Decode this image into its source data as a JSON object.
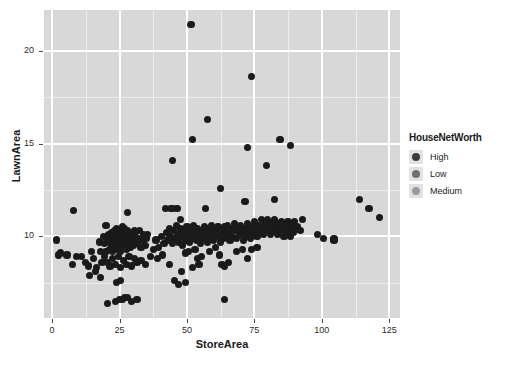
{
  "chart_data": {
    "type": "scatter",
    "title": "",
    "xlabel": "StoreArea",
    "ylabel": "LawnArea",
    "xlim": [
      -3,
      129
    ],
    "ylim": [
      5.6,
      22.2
    ],
    "xticks": [
      0,
      25,
      50,
      75,
      100,
      125
    ],
    "yticks": [
      10,
      15,
      20
    ],
    "grid": true,
    "panel_background": "#d8d8d8",
    "grid_color": "#ffffff",
    "point_color": "#1a1a1a",
    "legend": {
      "title": "HouseNetWorth",
      "position": "right",
      "entries": [
        {
          "label": "High",
          "color": "#3b3b3b"
        },
        {
          "label": "Low",
          "color": "#6e6e6e"
        },
        {
          "label": "Medium",
          "color": "#9a9a9a"
        }
      ]
    },
    "series": [
      {
        "name": "HouseNetWorth",
        "points": [
          [
            51.5,
            21.4
          ],
          [
            74.0,
            18.6
          ],
          [
            57.5,
            16.3
          ],
          [
            52.0,
            15.2
          ],
          [
            72.5,
            14.8
          ],
          [
            84.5,
            15.2
          ],
          [
            88.5,
            14.9
          ],
          [
            79.5,
            13.8
          ],
          [
            44.5,
            14.1
          ],
          [
            62.5,
            12.6
          ],
          [
            82.5,
            12.0
          ],
          [
            71.5,
            11.9
          ],
          [
            57.0,
            11.5
          ],
          [
            114.0,
            12.0
          ],
          [
            117.5,
            11.5
          ],
          [
            121.5,
            11.0
          ],
          [
            8.0,
            11.4
          ],
          [
            28.0,
            11.3
          ],
          [
            44.0,
            11.5
          ],
          [
            46.5,
            11.5
          ],
          [
            20.0,
            10.6
          ],
          [
            30.5,
            10.3
          ],
          [
            35.5,
            10.1
          ],
          [
            37.5,
            9.3
          ],
          [
            1.5,
            9.8
          ],
          [
            3.0,
            9.1
          ],
          [
            2.5,
            9.0
          ],
          [
            5.5,
            9.0
          ],
          [
            7.5,
            8.5
          ],
          [
            9.0,
            8.9
          ],
          [
            11.0,
            8.9
          ],
          [
            12.5,
            8.6
          ],
          [
            13.5,
            8.4
          ],
          [
            14.5,
            9.2
          ],
          [
            15.5,
            8.8
          ],
          [
            16.5,
            8.3
          ],
          [
            17.5,
            9.7
          ],
          [
            18.0,
            9.2
          ],
          [
            18.5,
            8.6
          ],
          [
            19.0,
            10.0
          ],
          [
            19.5,
            9.6
          ],
          [
            20.0,
            9.2
          ],
          [
            20.5,
            9.9
          ],
          [
            21.0,
            10.1
          ],
          [
            21.5,
            9.7
          ],
          [
            21.5,
            9.3
          ],
          [
            22.0,
            10.2
          ],
          [
            22.0,
            9.5
          ],
          [
            22.5,
            9.9
          ],
          [
            22.5,
            9.2
          ],
          [
            23.0,
            10.3
          ],
          [
            23.0,
            9.6
          ],
          [
            23.5,
            10.0
          ],
          [
            23.5,
            9.3
          ],
          [
            24.0,
            10.4
          ],
          [
            24.0,
            9.8
          ],
          [
            24.5,
            10.1
          ],
          [
            24.5,
            9.4
          ],
          [
            25.0,
            10.3
          ],
          [
            25.0,
            9.7
          ],
          [
            25.5,
            10.0
          ],
          [
            25.5,
            9.2
          ],
          [
            26.0,
            10.5
          ],
          [
            26.0,
            9.9
          ],
          [
            26.5,
            10.2
          ],
          [
            26.5,
            9.5
          ],
          [
            27.0,
            10.4
          ],
          [
            27.0,
            9.8
          ],
          [
            27.5,
            10.1
          ],
          [
            27.5,
            9.3
          ],
          [
            28.0,
            10.3
          ],
          [
            28.0,
            9.6
          ],
          [
            28.5,
            9.9
          ],
          [
            29.0,
            10.2
          ],
          [
            29.0,
            9.4
          ],
          [
            29.5,
            9.8
          ],
          [
            30.0,
            10.1
          ],
          [
            30.0,
            9.5
          ],
          [
            30.5,
            9.9
          ],
          [
            31.0,
            10.2
          ],
          [
            31.5,
            9.6
          ],
          [
            32.0,
            9.9
          ],
          [
            32.5,
            10.3
          ],
          [
            33.0,
            9.4
          ],
          [
            33.5,
            9.8
          ],
          [
            34.0,
            10.1
          ],
          [
            34.5,
            9.5
          ],
          [
            35.0,
            9.9
          ],
          [
            19.5,
            8.9
          ],
          [
            20.5,
            8.6
          ],
          [
            21.5,
            8.4
          ],
          [
            22.5,
            8.8
          ],
          [
            23.5,
            8.5
          ],
          [
            24.5,
            8.9
          ],
          [
            25.5,
            8.3
          ],
          [
            26.5,
            8.7
          ],
          [
            27.5,
            8.5
          ],
          [
            28.5,
            8.9
          ],
          [
            29.5,
            8.4
          ],
          [
            30.5,
            8.8
          ],
          [
            31.5,
            8.6
          ],
          [
            33.0,
            8.7
          ],
          [
            34.5,
            8.5
          ],
          [
            16.0,
            8.1
          ],
          [
            14.0,
            7.9
          ],
          [
            18.0,
            7.8
          ],
          [
            24.0,
            7.5
          ],
          [
            25.5,
            7.6
          ],
          [
            20.5,
            6.4
          ],
          [
            23.5,
            6.5
          ],
          [
            25.0,
            6.6
          ],
          [
            26.0,
            6.6
          ],
          [
            27.0,
            6.7
          ],
          [
            28.0,
            6.7
          ],
          [
            29.5,
            6.5
          ],
          [
            31.5,
            6.6
          ],
          [
            38.5,
            9.8
          ],
          [
            39.5,
            9.4
          ],
          [
            40.5,
            10.0
          ],
          [
            41.5,
            9.6
          ],
          [
            42.5,
            10.2
          ],
          [
            43.0,
            9.8
          ],
          [
            43.5,
            10.4
          ],
          [
            44.0,
            10.0
          ],
          [
            44.5,
            9.6
          ],
          [
            45.0,
            10.3
          ],
          [
            45.5,
            9.9
          ],
          [
            46.0,
            10.6
          ],
          [
            46.5,
            10.1
          ],
          [
            47.0,
            9.7
          ],
          [
            47.5,
            10.4
          ],
          [
            48.0,
            10.0
          ],
          [
            48.5,
            9.5
          ],
          [
            49.0,
            10.2
          ],
          [
            49.5,
            9.8
          ],
          [
            50.0,
            10.5
          ],
          [
            50.5,
            10.1
          ],
          [
            51.0,
            9.7
          ],
          [
            51.5,
            10.3
          ],
          [
            52.0,
            9.9
          ],
          [
            52.5,
            10.6
          ],
          [
            53.0,
            10.2
          ],
          [
            53.5,
            9.8
          ],
          [
            54.0,
            10.4
          ],
          [
            54.5,
            10.0
          ],
          [
            55.0,
            9.6
          ],
          [
            55.5,
            10.3
          ],
          [
            56.0,
            9.9
          ],
          [
            56.5,
            10.5
          ],
          [
            57.0,
            10.1
          ],
          [
            57.5,
            9.7
          ],
          [
            58.0,
            10.4
          ],
          [
            58.5,
            10.0
          ],
          [
            59.0,
            10.6
          ],
          [
            59.5,
            10.2
          ],
          [
            60.0,
            9.8
          ],
          [
            60.5,
            10.4
          ],
          [
            61.0,
            10.0
          ],
          [
            61.5,
            10.5
          ],
          [
            62.0,
            10.1
          ],
          [
            62.5,
            9.7
          ],
          [
            63.0,
            10.3
          ],
          [
            63.5,
            9.9
          ],
          [
            64.0,
            10.5
          ],
          [
            64.5,
            10.1
          ],
          [
            65.0,
            10.6
          ],
          [
            65.5,
            10.2
          ],
          [
            66.0,
            9.8
          ],
          [
            66.5,
            10.4
          ],
          [
            67.0,
            10.0
          ],
          [
            67.5,
            10.7
          ],
          [
            68.0,
            10.3
          ],
          [
            68.5,
            9.9
          ],
          [
            69.0,
            10.5
          ],
          [
            69.5,
            10.1
          ],
          [
            70.0,
            10.6
          ],
          [
            70.5,
            10.2
          ],
          [
            71.0,
            9.8
          ],
          [
            71.5,
            10.4
          ],
          [
            72.0,
            10.0
          ],
          [
            72.5,
            10.7
          ],
          [
            73.0,
            10.3
          ],
          [
            73.5,
            9.9
          ],
          [
            74.0,
            10.5
          ],
          [
            74.5,
            10.1
          ],
          [
            75.0,
            10.8
          ],
          [
            75.5,
            10.4
          ],
          [
            76.0,
            10.0
          ],
          [
            76.5,
            10.6
          ],
          [
            77.0,
            10.2
          ],
          [
            77.5,
            10.9
          ],
          [
            78.0,
            10.5
          ],
          [
            78.5,
            10.1
          ],
          [
            79.0,
            10.7
          ],
          [
            79.5,
            10.3
          ],
          [
            80.0,
            10.9
          ],
          [
            80.5,
            10.5
          ],
          [
            81.0,
            10.1
          ],
          [
            81.5,
            10.7
          ],
          [
            82.0,
            10.3
          ],
          [
            82.5,
            10.9
          ],
          [
            83.0,
            10.5
          ],
          [
            83.5,
            10.1
          ],
          [
            84.0,
            10.7
          ],
          [
            84.5,
            10.3
          ],
          [
            85.0,
            10.8
          ],
          [
            85.5,
            10.4
          ],
          [
            86.0,
            10.0
          ],
          [
            86.5,
            10.6
          ],
          [
            87.0,
            10.2
          ],
          [
            87.5,
            10.8
          ],
          [
            88.0,
            10.4
          ],
          [
            88.5,
            10.0
          ],
          [
            89.0,
            10.6
          ],
          [
            89.5,
            10.2
          ],
          [
            90.0,
            10.8
          ],
          [
            90.5,
            10.4
          ],
          [
            91.0,
            10.5
          ],
          [
            92.0,
            10.3
          ],
          [
            93.0,
            10.9
          ],
          [
            98.5,
            10.1
          ],
          [
            104.5,
            9.9
          ],
          [
            104.5,
            9.8
          ],
          [
            100.5,
            9.9
          ],
          [
            42.0,
            11.5
          ],
          [
            44.5,
            11.5
          ],
          [
            46.0,
            11.5
          ],
          [
            47.5,
            10.9
          ],
          [
            49.5,
            9.1
          ],
          [
            50.5,
            9.2
          ],
          [
            53.0,
            9.3
          ],
          [
            54.0,
            8.8
          ],
          [
            55.5,
            8.9
          ],
          [
            58.5,
            9.2
          ],
          [
            60.5,
            9.4
          ],
          [
            62.0,
            9.0
          ],
          [
            63.0,
            8.5
          ],
          [
            64.0,
            8.4
          ],
          [
            65.5,
            8.6
          ],
          [
            68.5,
            9.2
          ],
          [
            70.5,
            9.3
          ],
          [
            72.5,
            8.8
          ],
          [
            74.0,
            9.3
          ],
          [
            76.0,
            9.4
          ],
          [
            45.5,
            7.6
          ],
          [
            47.0,
            7.4
          ],
          [
            48.0,
            8.1
          ],
          [
            49.5,
            7.5
          ],
          [
            52.0,
            8.3
          ],
          [
            54.5,
            8.5
          ],
          [
            64.0,
            6.6
          ],
          [
            43.5,
            8.5
          ],
          [
            41.0,
            9.0
          ],
          [
            39.0,
            8.8
          ],
          [
            36.5,
            8.9
          ]
        ]
      }
    ]
  }
}
